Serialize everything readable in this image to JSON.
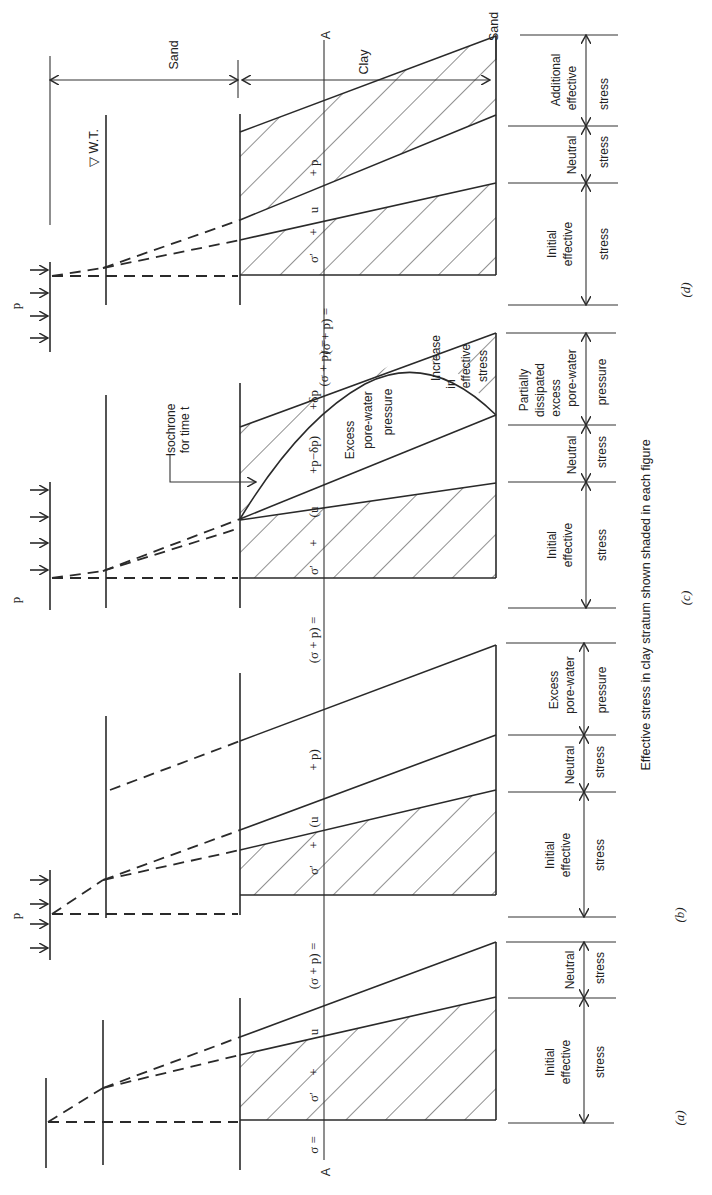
{
  "figure": {
    "orientation": "rotated 90 degrees (text reads bottom-to-top)",
    "caption": "Effective stress in clay stratum shown shaded in each figure",
    "strata": {
      "top": "Sand",
      "middle": "Clay",
      "bottom": "Sand",
      "water_table": "▽ W.T."
    },
    "section_line": {
      "start": "A",
      "end": "A"
    },
    "load_label": "p",
    "panels": [
      {
        "id": "a",
        "label": "(a)",
        "equation": [
          "σ =",
          "σ′",
          "+",
          "u"
        ],
        "annotations": [
          {
            "label_lines": [
              "Initial",
              "effective",
              "stress"
            ]
          },
          {
            "label_lines": [
              "Neutral",
              "stress"
            ]
          }
        ]
      },
      {
        "id": "b",
        "label": "(b)",
        "equation": [
          "(σ + p) =",
          "σ′",
          "+",
          "(u",
          "+ p)"
        ],
        "annotations": [
          {
            "label_lines": [
              "Initial",
              "effective",
              "stress"
            ]
          },
          {
            "label_lines": [
              "Neutral",
              "stress"
            ]
          },
          {
            "label_lines": [
              "Excess",
              "pore-water",
              "pressure"
            ]
          }
        ]
      },
      {
        "id": "c",
        "label": "(c)",
        "equation": [
          "(σ + p) =",
          "σ′",
          "+",
          "(u",
          "+p−δp)",
          "+δp"
        ],
        "isochrone_label": [
          "Isochrone",
          "for time t"
        ],
        "inner_labels": {
          "excess": [
            "Excess",
            "pore-water",
            "pressure"
          ],
          "increase": [
            "Increase",
            "in",
            "effective",
            "stress"
          ]
        },
        "annotations": [
          {
            "label_lines": [
              "Initial",
              "effective",
              "stress"
            ]
          },
          {
            "label_lines": [
              "Neutral",
              "stress"
            ]
          },
          {
            "label_lines": [
              "Partially",
              "dissipated",
              "excess",
              "pore-water",
              "pressure"
            ]
          }
        ]
      },
      {
        "id": "d",
        "label": "(d)",
        "equation": [
          "(σ + p) =",
          "σ′",
          "+",
          "u",
          "+ p"
        ],
        "annotations": [
          {
            "label_lines": [
              "Initial",
              "effective",
              "stress"
            ]
          },
          {
            "label_lines": [
              "Neutral",
              "stress"
            ]
          },
          {
            "label_lines": [
              "Additional",
              "effective",
              "stress"
            ]
          }
        ]
      }
    ]
  }
}
